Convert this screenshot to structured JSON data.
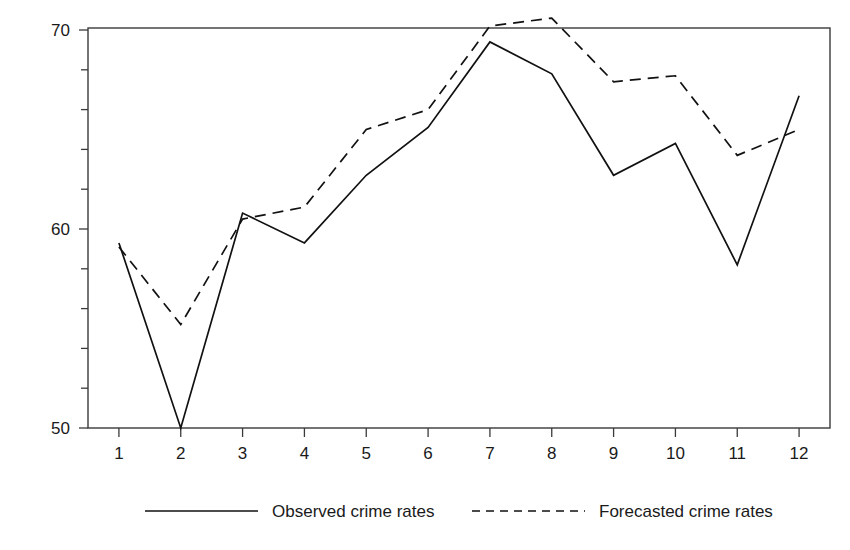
{
  "chart_data": {
    "type": "line",
    "title": "",
    "xlabel": "",
    "ylabel": "",
    "categories": [
      "1",
      "2",
      "3",
      "4",
      "5",
      "6",
      "7",
      "8",
      "9",
      "10",
      "11",
      "12"
    ],
    "x": [
      1,
      2,
      3,
      4,
      5,
      6,
      7,
      8,
      9,
      10,
      11,
      12
    ],
    "series": [
      {
        "name": "Observed crime rates",
        "style": "solid",
        "color": "#111111",
        "values": [
          59.3,
          50.0,
          60.8,
          59.3,
          62.7,
          65.1,
          69.4,
          67.8,
          62.7,
          64.3,
          58.2,
          66.7
        ]
      },
      {
        "name": "Forecasted crime rates",
        "style": "dashed",
        "color": "#111111",
        "values": [
          59.1,
          55.2,
          60.5,
          61.1,
          65.0,
          66.0,
          70.2,
          70.6,
          67.4,
          67.7,
          63.7,
          65.0
        ]
      }
    ],
    "ylim": [
      50,
      70.6
    ],
    "xlim": [
      0.5,
      12.5
    ],
    "y_major_ticks": [
      50,
      60,
      70
    ],
    "y_major_tick_labels": [
      "50",
      "60",
      "70"
    ],
    "y_minor_ticks": [
      52,
      54,
      56,
      58,
      62,
      64,
      66,
      68
    ],
    "grid": false,
    "legend_position": "bottom-center",
    "frame": "box"
  },
  "legend": {
    "entries": [
      {
        "label": "Observed crime rates",
        "style": "solid"
      },
      {
        "label": "Forecasted crime rates",
        "style": "dashed"
      }
    ]
  }
}
